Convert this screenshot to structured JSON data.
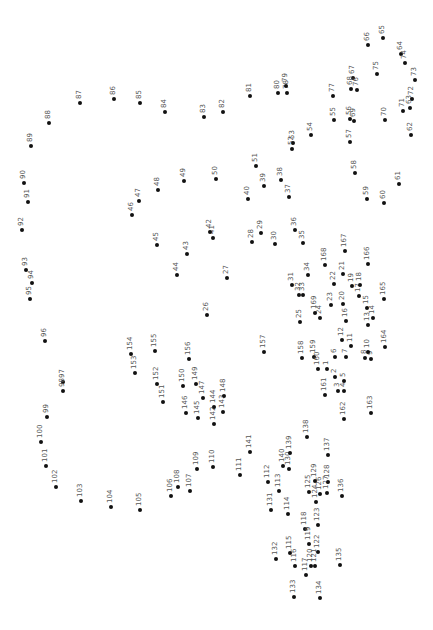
{
  "puzzle": {
    "type": "connect-the-dots",
    "orientation": "rotated-90",
    "dots": [
      {
        "n": "1",
        "x": 327,
        "y": 369
      },
      {
        "n": "2",
        "x": 335,
        "y": 377
      },
      {
        "n": "3",
        "x": 338,
        "y": 391
      },
      {
        "n": "4",
        "x": 344,
        "y": 391
      },
      {
        "n": "5",
        "x": 344,
        "y": 381
      },
      {
        "n": "6",
        "x": 335,
        "y": 357
      },
      {
        "n": "7",
        "x": 346,
        "y": 357
      },
      {
        "n": "8",
        "x": 365,
        "y": 358
      },
      {
        "n": "9",
        "x": 371,
        "y": 359
      },
      {
        "n": "10",
        "x": 368,
        "y": 352
      },
      {
        "n": "11",
        "x": 351,
        "y": 346
      },
      {
        "n": "12",
        "x": 342,
        "y": 340
      },
      {
        "n": "13",
        "x": 368,
        "y": 325
      },
      {
        "n": "14",
        "x": 373,
        "y": 318
      },
      {
        "n": "15",
        "x": 367,
        "y": 308
      },
      {
        "n": "16",
        "x": 346,
        "y": 321
      },
      {
        "n": "17",
        "x": 359,
        "y": 296
      },
      {
        "n": "18",
        "x": 360,
        "y": 285
      },
      {
        "n": "19",
        "x": 352,
        "y": 286
      },
      {
        "n": "20",
        "x": 343,
        "y": 304
      },
      {
        "n": "21",
        "x": 343,
        "y": 274
      },
      {
        "n": "22",
        "x": 334,
        "y": 284
      },
      {
        "n": "23",
        "x": 331,
        "y": 305
      },
      {
        "n": "24",
        "x": 320,
        "y": 318
      },
      {
        "n": "25",
        "x": 300,
        "y": 322
      },
      {
        "n": "26",
        "x": 207,
        "y": 315
      },
      {
        "n": "27",
        "x": 227,
        "y": 278
      },
      {
        "n": "28",
        "x": 252,
        "y": 242
      },
      {
        "n": "29",
        "x": 261,
        "y": 233
      },
      {
        "n": "30",
        "x": 275,
        "y": 244
      },
      {
        "n": "31",
        "x": 292,
        "y": 285
      },
      {
        "n": "32",
        "x": 299,
        "y": 295
      },
      {
        "n": "33",
        "x": 303,
        "y": 295
      },
      {
        "n": "34",
        "x": 308,
        "y": 275
      },
      {
        "n": "35",
        "x": 303,
        "y": 243
      },
      {
        "n": "36",
        "x": 295,
        "y": 230
      },
      {
        "n": "37",
        "x": 289,
        "y": 197
      },
      {
        "n": "38",
        "x": 281,
        "y": 180
      },
      {
        "n": "39",
        "x": 264,
        "y": 186
      },
      {
        "n": "40",
        "x": 248,
        "y": 199
      },
      {
        "n": "41",
        "x": 213,
        "y": 238
      },
      {
        "n": "42",
        "x": 210,
        "y": 232
      },
      {
        "n": "43",
        "x": 187,
        "y": 254
      },
      {
        "n": "44",
        "x": 177,
        "y": 275
      },
      {
        "n": "45",
        "x": 157,
        "y": 245
      },
      {
        "n": "46",
        "x": 132,
        "y": 215
      },
      {
        "n": "47",
        "x": 139,
        "y": 201
      },
      {
        "n": "48",
        "x": 158,
        "y": 190
      },
      {
        "n": "49",
        "x": 184,
        "y": 181
      },
      {
        "n": "50",
        "x": 216,
        "y": 179
      },
      {
        "n": "51",
        "x": 256,
        "y": 166
      },
      {
        "n": "52",
        "x": 292,
        "y": 149
      },
      {
        "n": "53",
        "x": 293,
        "y": 143
      },
      {
        "n": "54",
        "x": 311,
        "y": 135
      },
      {
        "n": "55",
        "x": 334,
        "y": 120
      },
      {
        "n": "56",
        "x": 350,
        "y": 119
      },
      {
        "n": "57",
        "x": 350,
        "y": 142
      },
      {
        "n": "58",
        "x": 355,
        "y": 173
      },
      {
        "n": "59",
        "x": 367,
        "y": 199
      },
      {
        "n": "60",
        "x": 384,
        "y": 203
      },
      {
        "n": "61",
        "x": 399,
        "y": 184
      },
      {
        "n": "62",
        "x": 411,
        "y": 135
      },
      {
        "n": "63",
        "x": 410,
        "y": 108
      },
      {
        "n": "64",
        "x": 401,
        "y": 54
      },
      {
        "n": "65",
        "x": 383,
        "y": 38
      },
      {
        "n": "66",
        "x": 368,
        "y": 45
      },
      {
        "n": "67",
        "x": 353,
        "y": 78
      },
      {
        "n": "68",
        "x": 351,
        "y": 89
      },
      {
        "n": "69",
        "x": 354,
        "y": 121
      },
      {
        "n": "70",
        "x": 385,
        "y": 120
      },
      {
        "n": "71",
        "x": 403,
        "y": 111
      },
      {
        "n": "72",
        "x": 412,
        "y": 99
      },
      {
        "n": "73",
        "x": 415,
        "y": 80
      },
      {
        "n": "74",
        "x": 405,
        "y": 63
      },
      {
        "n": "75",
        "x": 377,
        "y": 74
      },
      {
        "n": "76",
        "x": 357,
        "y": 90
      },
      {
        "n": "77",
        "x": 333,
        "y": 96
      },
      {
        "n": "78",
        "x": 287,
        "y": 93
      },
      {
        "n": "79",
        "x": 286,
        "y": 86
      },
      {
        "n": "80",
        "x": 278,
        "y": 93
      },
      {
        "n": "81",
        "x": 250,
        "y": 96
      },
      {
        "n": "82",
        "x": 223,
        "y": 112
      },
      {
        "n": "83",
        "x": 204,
        "y": 117
      },
      {
        "n": "84",
        "x": 165,
        "y": 112
      },
      {
        "n": "85",
        "x": 140,
        "y": 103
      },
      {
        "n": "86",
        "x": 114,
        "y": 99
      },
      {
        "n": "87",
        "x": 80,
        "y": 103
      },
      {
        "n": "88",
        "x": 49,
        "y": 123
      },
      {
        "n": "89",
        "x": 31,
        "y": 146
      },
      {
        "n": "90",
        "x": 24,
        "y": 183
      },
      {
        "n": "91",
        "x": 28,
        "y": 202
      },
      {
        "n": "92",
        "x": 22,
        "y": 230
      },
      {
        "n": "93",
        "x": 26,
        "y": 270
      },
      {
        "n": "94",
        "x": 32,
        "y": 283
      },
      {
        "n": "95",
        "x": 30,
        "y": 299
      },
      {
        "n": "96",
        "x": 45,
        "y": 341
      },
      {
        "n": "97",
        "x": 63,
        "y": 382
      },
      {
        "n": "98",
        "x": 63,
        "y": 391
      },
      {
        "n": "99",
        "x": 47,
        "y": 417
      },
      {
        "n": "100",
        "x": 41,
        "y": 442
      },
      {
        "n": "101",
        "x": 46,
        "y": 466
      },
      {
        "n": "102",
        "x": 56,
        "y": 487
      },
      {
        "n": "103",
        "x": 81,
        "y": 501
      },
      {
        "n": "104",
        "x": 111,
        "y": 507
      },
      {
        "n": "105",
        "x": 140,
        "y": 510
      },
      {
        "n": "106",
        "x": 171,
        "y": 496
      },
      {
        "n": "107",
        "x": 190,
        "y": 491
      },
      {
        "n": "108",
        "x": 178,
        "y": 487
      },
      {
        "n": "109",
        "x": 197,
        "y": 469
      },
      {
        "n": "110",
        "x": 213,
        "y": 467
      },
      {
        "n": "111",
        "x": 240,
        "y": 475
      },
      {
        "n": "112",
        "x": 268,
        "y": 482
      },
      {
        "n": "113",
        "x": 279,
        "y": 491
      },
      {
        "n": "114",
        "x": 288,
        "y": 514
      },
      {
        "n": "115",
        "x": 290,
        "y": 553
      },
      {
        "n": "116",
        "x": 295,
        "y": 566
      },
      {
        "n": "117",
        "x": 306,
        "y": 575
      },
      {
        "n": "118",
        "x": 305,
        "y": 529
      },
      {
        "n": "119",
        "x": 309,
        "y": 544
      },
      {
        "n": "120",
        "x": 311,
        "y": 566
      },
      {
        "n": "121",
        "x": 315,
        "y": 566
      },
      {
        "n": "122",
        "x": 318,
        "y": 552
      },
      {
        "n": "123",
        "x": 318,
        "y": 525
      },
      {
        "n": "124",
        "x": 316,
        "y": 502
      },
      {
        "n": "125",
        "x": 309,
        "y": 492
      },
      {
        "n": "126",
        "x": 320,
        "y": 494
      },
      {
        "n": "127",
        "x": 327,
        "y": 493
      },
      {
        "n": "128",
        "x": 328,
        "y": 482
      },
      {
        "n": "129",
        "x": 315,
        "y": 481
      },
      {
        "n": "130",
        "x": 289,
        "y": 469
      },
      {
        "n": "131",
        "x": 271,
        "y": 510
      },
      {
        "n": "132",
        "x": 276,
        "y": 559
      },
      {
        "n": "133",
        "x": 294,
        "y": 597
      },
      {
        "n": "134",
        "x": 320,
        "y": 598
      },
      {
        "n": "135",
        "x": 340,
        "y": 565
      },
      {
        "n": "136",
        "x": 342,
        "y": 496
      },
      {
        "n": "137",
        "x": 328,
        "y": 455
      },
      {
        "n": "138",
        "x": 307,
        "y": 437
      },
      {
        "n": "139",
        "x": 290,
        "y": 453
      },
      {
        "n": "140",
        "x": 283,
        "y": 466
      },
      {
        "n": "141",
        "x": 250,
        "y": 452
      },
      {
        "n": "142",
        "x": 214,
        "y": 424
      },
      {
        "n": "143",
        "x": 223,
        "y": 412
      },
      {
        "n": "144",
        "x": 214,
        "y": 407
      },
      {
        "n": "145",
        "x": 198,
        "y": 418
      },
      {
        "n": "146",
        "x": 186,
        "y": 413
      },
      {
        "n": "147",
        "x": 203,
        "y": 398
      },
      {
        "n": "148",
        "x": 224,
        "y": 396
      },
      {
        "n": "149",
        "x": 196,
        "y": 384
      },
      {
        "n": "150",
        "x": 183,
        "y": 386
      },
      {
        "n": "151",
        "x": 163,
        "y": 402
      },
      {
        "n": "152",
        "x": 157,
        "y": 384
      },
      {
        "n": "153",
        "x": 135,
        "y": 373
      },
      {
        "n": "154",
        "x": 131,
        "y": 354
      },
      {
        "n": "155",
        "x": 155,
        "y": 351
      },
      {
        "n": "156",
        "x": 189,
        "y": 359
      },
      {
        "n": "157",
        "x": 264,
        "y": 352
      },
      {
        "n": "158",
        "x": 302,
        "y": 358
      },
      {
        "n": "159",
        "x": 314,
        "y": 357
      },
      {
        "n": "160",
        "x": 318,
        "y": 369
      },
      {
        "n": "161",
        "x": 325,
        "y": 395
      },
      {
        "n": "162",
        "x": 344,
        "y": 419
      },
      {
        "n": "163",
        "x": 371,
        "y": 413
      },
      {
        "n": "164",
        "x": 385,
        "y": 347
      },
      {
        "n": "165",
        "x": 384,
        "y": 299
      },
      {
        "n": "166",
        "x": 368,
        "y": 264
      },
      {
        "n": "167",
        "x": 345,
        "y": 251
      },
      {
        "n": "168",
        "x": 325,
        "y": 265
      },
      {
        "n": "169",
        "x": 315,
        "y": 313
      }
    ]
  }
}
